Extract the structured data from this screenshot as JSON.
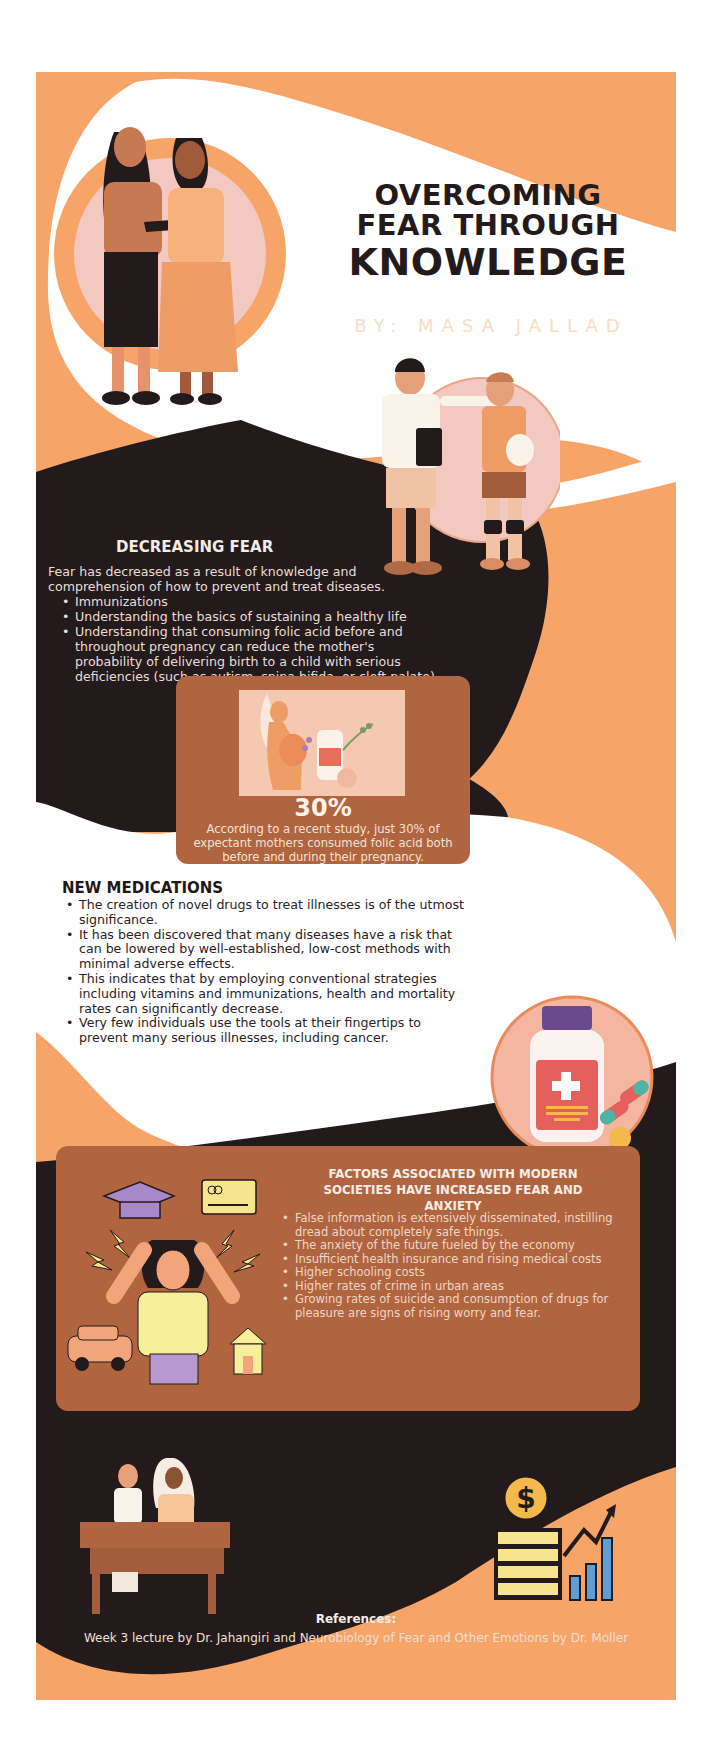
{
  "poster": {
    "title": {
      "line1": "OVERCOMING",
      "line2": "FEAR THROUGH",
      "line3": "KNOWLEDGE"
    },
    "byline": "BY: MASA JALLAD",
    "colors": {
      "peach": "#f7a468",
      "dark": "#231a1c",
      "card_brown": "#b0643f",
      "white": "#ffffff",
      "pink_circle": "#f3c8c0"
    }
  },
  "decreasing_fear": {
    "heading": "DECREASING FEAR",
    "intro": "Fear has decreased as a result of knowledge and comprehension of how to prevent and treat diseases.",
    "bullets": [
      "Immunizations",
      "Understanding the basics of sustaining a healthy life",
      "Understanding that consuming folic acid before and throughout pregnancy can reduce the mother's probability of delivering birth to a child with serious deficiencies (such as autism, spina bifida, or cleft palate)"
    ]
  },
  "stat_card": {
    "value": "30%",
    "description": "According to a recent study, just 30% of expectant mothers consumed folic acid both before and during their pregnancy.",
    "image_label": "pregnant-woman-with-folic-acid-illustration"
  },
  "new_medications": {
    "heading": "NEW MEDICATIONS",
    "bullets": [
      "The creation of novel drugs to treat illnesses is of the utmost significance.",
      "It has been discovered that many diseases have a risk that can be lowered by well-established, low-cost methods with minimal adverse effects.",
      "This indicates that by employing conventional strategies including vitamins and immunizations, health and mortality rates can significantly decrease.",
      "Very few individuals use the tools at their fingertips to prevent many serious illnesses, including cancer."
    ]
  },
  "factors": {
    "heading": "FACTORS ASSOCIATED WITH MODERN SOCIETIES HAVE INCREASED FEAR AND ANXIETY",
    "bullets": [
      "False information is extensively disseminated, instilling dread about completely safe things.",
      "The anxiety of the future fueled by the economy",
      "Insufficient health insurance and rising medical costs",
      "Higher schooling costs",
      "Higher rates of crime in urban areas",
      "Growing rates of suicide and consumption of drugs for pleasure are signs of rising worry and fear."
    ]
  },
  "references": {
    "heading": "References:",
    "text": "Week 3 lecture by Dr. Jahangiri and Neurobiology of Fear and Other Emotions by Dr. Moller"
  }
}
